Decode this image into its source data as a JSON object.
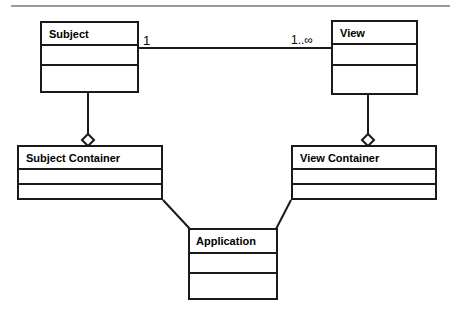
{
  "diagram": {
    "kind": "uml-class-diagram",
    "top_rule": {
      "visible": true,
      "color": "#9a9a9a"
    },
    "stroke_color": "#1a1a1a",
    "fill_color": "#ffffff",
    "classes": [
      {
        "id": "subject",
        "name": "Subject",
        "x": 40,
        "y": 21,
        "w": 99,
        "h": 72,
        "title_h": 23,
        "comp2_h": 20,
        "title_pad": 7,
        "font_size": 11
      },
      {
        "id": "view",
        "name": "View",
        "x": 331,
        "y": 20,
        "w": 87,
        "h": 75,
        "title_h": 23,
        "comp2_h": 21,
        "title_pad": 7,
        "font_size": 11
      },
      {
        "id": "subject-container",
        "name": "Subject Container",
        "x": 17,
        "y": 145,
        "w": 146,
        "h": 55,
        "title_h": 23,
        "comp2_h": 15,
        "title_pad": 7,
        "font_size": 11
      },
      {
        "id": "view-container",
        "name": "View Container",
        "x": 291,
        "y": 145,
        "w": 146,
        "h": 55,
        "title_h": 23,
        "comp2_h": 15,
        "title_pad": 7,
        "font_size": 11
      },
      {
        "id": "application",
        "name": "Application",
        "x": 188,
        "y": 228,
        "w": 90,
        "h": 72,
        "title_h": 24,
        "comp2_h": 20,
        "title_pad": 6,
        "font_size": 11
      }
    ],
    "associations": [
      {
        "id": "subject-view",
        "type": "association",
        "from": "subject",
        "to": "view",
        "x1": 139,
        "y1": 48,
        "x2": 331,
        "y2": 48,
        "source_multiplicity": "1",
        "target_multiplicity": "1..∞",
        "source_label_x": 143,
        "source_label_y": 35,
        "target_label_x": 291,
        "target_label_y": 34,
        "source_label_size": 12,
        "target_label_size": 11
      }
    ],
    "aggregations": [
      {
        "id": "subject-in-subject-container",
        "type": "aggregation",
        "whole": "subject-container",
        "part": "subject",
        "x1": 88,
        "y1": 93,
        "x2": 88,
        "y2": 134,
        "diamond_cx": 88,
        "diamond_cy": 140,
        "diamond_rx": 6,
        "diamond_ry": 6
      },
      {
        "id": "view-in-view-container",
        "type": "aggregation",
        "whole": "view-container",
        "part": "view",
        "x1": 368,
        "y1": 95,
        "x2": 368,
        "y2": 134,
        "diamond_cx": 368,
        "diamond_cy": 140,
        "diamond_rx": 6,
        "diamond_ry": 6
      }
    ],
    "links": [
      {
        "id": "subject-container-application",
        "type": "association",
        "from": "subject-container",
        "to": "application",
        "x1": 163,
        "y1": 200,
        "x2": 189,
        "y2": 228
      },
      {
        "id": "view-container-application",
        "type": "association",
        "from": "view-container",
        "to": "application",
        "x1": 291,
        "y1": 200,
        "x2": 277,
        "y2": 228
      }
    ]
  },
  "labels": {
    "subject": "Subject",
    "view": "View",
    "subject_container": "Subject Container",
    "view_container": "View Container",
    "application": "Application",
    "mult_one": "1",
    "mult_one_to_many": "1..∞"
  }
}
